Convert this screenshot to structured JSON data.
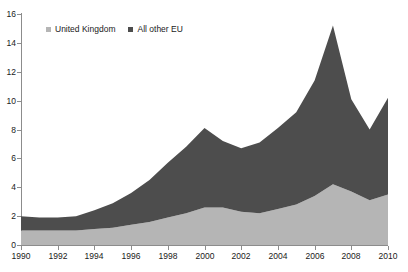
{
  "chart_data": {
    "type": "area",
    "stacked": true,
    "title": "",
    "subtitle": "",
    "xlabel": "",
    "ylabel": "",
    "xlim": [
      1990,
      2010
    ],
    "ylim": [
      0,
      16
    ],
    "y_ticks": [
      0,
      2,
      4,
      6,
      8,
      10,
      12,
      14,
      16
    ],
    "x_ticks": [
      1990,
      1992,
      1994,
      1996,
      1998,
      2000,
      2002,
      2004,
      2006,
      2008,
      2010
    ],
    "x_tick_labels": [
      "1990",
      "1992",
      "1994",
      "1996",
      "1998",
      "2000",
      "2002",
      "2004",
      "2006",
      "2008",
      "2010"
    ],
    "y_tick_labels": [
      "0",
      "2",
      "4",
      "6",
      "8",
      "10",
      "12",
      "14",
      "16"
    ],
    "grid": false,
    "legend_position": "top-left-inside",
    "x": [
      1990,
      1991,
      1992,
      1993,
      1994,
      1995,
      1996,
      1997,
      1998,
      1999,
      2000,
      2001,
      2002,
      2003,
      2004,
      2005,
      2006,
      2007,
      2008,
      2009,
      2010
    ],
    "series": [
      {
        "name": "United Kingdom",
        "color": "#b5b5b5",
        "values": [
          1.0,
          1.0,
          1.0,
          1.0,
          1.1,
          1.2,
          1.4,
          1.6,
          1.9,
          2.2,
          2.6,
          2.6,
          2.3,
          2.2,
          2.5,
          2.8,
          3.4,
          4.2,
          3.7,
          3.1,
          3.5
        ]
      },
      {
        "name": "All other EU",
        "color": "#4d4d4d",
        "values": [
          1.0,
          0.9,
          0.9,
          1.0,
          1.3,
          1.7,
          2.2,
          2.9,
          3.8,
          4.6,
          5.5,
          4.6,
          4.4,
          4.9,
          5.6,
          6.4,
          8.0,
          11.0,
          6.4,
          4.9,
          6.7
        ]
      }
    ],
    "totals": [
      2.0,
      1.9,
      1.9,
      2.0,
      2.4,
      2.9,
      3.6,
      4.5,
      5.7,
      6.8,
      8.1,
      7.2,
      6.7,
      7.1,
      8.1,
      9.2,
      11.4,
      15.2,
      10.1,
      8.0,
      10.2
    ]
  },
  "legend": {
    "items": [
      {
        "label": "United Kingdom",
        "color": "#b5b5b5"
      },
      {
        "label": "All other EU",
        "color": "#4d4d4d"
      }
    ]
  },
  "axes": {
    "y_axis_name": "value-axis",
    "x_axis_name": "year-axis"
  }
}
